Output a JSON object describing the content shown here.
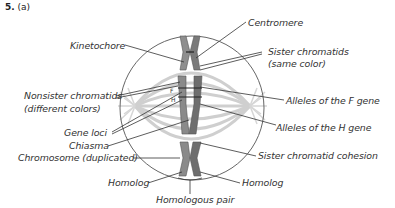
{
  "figure": {
    "number": "5.",
    "part": "(a)"
  },
  "labels": {
    "kinetochore": "Kinetochore",
    "centromere": "Centromere",
    "sister_chromatids": "Sister chromatids",
    "sister_chromatids_note": "(same color)",
    "nonsister_chromatids": "Nonsister chromatids",
    "nonsister_chromatids_note": "(different colors)",
    "alleles_f": "Alleles of the F gene",
    "alleles_h": "Alleles of the H gene",
    "gene_loci": "Gene loci",
    "chiasma": "Chiasma",
    "chromosome_duplicated": "Chromosome (duplicated)",
    "sister_chromatid_cohesion": "Sister chromatid cohesion",
    "homolog_left": "Homolog",
    "homolog_right": "Homolog",
    "homologous_pair": "Homologous pair"
  },
  "markers": {
    "allele_f": "F",
    "allele_h": "H"
  },
  "colors": {
    "spindle": "#c8c8c8",
    "cell_outline": "#555555",
    "chromosome": "#8a8a8a",
    "chromosome_dark": "#5a5a5a",
    "leader_line": "#333333"
  }
}
